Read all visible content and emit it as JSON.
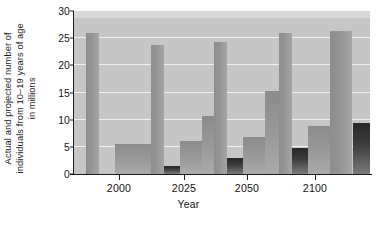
{
  "chart_data": {
    "type": "bar",
    "title": "",
    "xlabel": "Year",
    "ylabel": "Actual and projected number of individuals from 10–19 years of age in millions",
    "ylabel_lines": [
      "Actual and projected number of",
      "individuals from 10–19 years of age",
      "in millions"
    ],
    "categories": [
      "2000",
      "2025",
      "2050",
      "2100"
    ],
    "ylim": [
      0,
      30
    ],
    "yticks": [
      0,
      5,
      10,
      15,
      20,
      25,
      30
    ],
    "ytick_labels": [
      "0",
      "5",
      "10",
      "15",
      "20",
      "25",
      "30"
    ],
    "grid": true,
    "grid_color": "#f0f0f0",
    "legend": "none",
    "plot_background": "#c6c6c6",
    "colors": {
      "light_bar": "#949494",
      "mid_bar": "#9a9a9a",
      "dark_bar": "#2f2f2f",
      "axis": "#1d1d1d",
      "text": "#141414"
    },
    "groups": [
      {
        "category": "2000",
        "bars": [
          {
            "series": "tall",
            "value": 25.9,
            "shade": "light"
          },
          {
            "series": "mid-a",
            "value": 5.5,
            "shade": "mid"
          },
          {
            "series": "mid-b",
            "value": 5.5,
            "shade": "mid"
          },
          {
            "series": "short-dark",
            "value": 1.5,
            "shade": "dark"
          }
        ]
      },
      {
        "category": "2025",
        "bars": [
          {
            "series": "tall",
            "value": 23.8,
            "shade": "light"
          },
          {
            "series": "mid-a",
            "value": 6.0,
            "shade": "mid"
          },
          {
            "series": "mid-b",
            "value": 10.7,
            "shade": "mid"
          },
          {
            "series": "short-dark",
            "value": 2.9,
            "shade": "dark"
          }
        ]
      },
      {
        "category": "2050",
        "bars": [
          {
            "series": "tall",
            "value": 24.3,
            "shade": "light"
          },
          {
            "series": "mid-a",
            "value": 6.8,
            "shade": "mid"
          },
          {
            "series": "mid-b",
            "value": 15.2,
            "shade": "mid"
          },
          {
            "series": "short-dark",
            "value": 4.8,
            "shade": "dark"
          }
        ]
      },
      {
        "category": "2100",
        "bars": [
          {
            "series": "tall",
            "value": 25.9,
            "shade": "light"
          },
          {
            "series": "mid-a",
            "value": 8.9,
            "shade": "mid"
          },
          {
            "series": "mid-b",
            "value": 26.3,
            "shade": "light"
          },
          {
            "series": "short-dark",
            "value": 9.4,
            "shade": "dark"
          }
        ]
      }
    ],
    "series_values": {
      "tall": [
        25.9,
        23.8,
        24.3,
        25.9
      ],
      "mid_a": [
        5.5,
        6.0,
        6.8,
        8.9
      ],
      "mid_b": [
        5.5,
        10.7,
        15.2,
        26.3
      ],
      "short_dark": [
        1.5,
        2.9,
        4.8,
        9.4
      ]
    }
  },
  "axes": {
    "x_title": "Year",
    "y_title_line1": "Actual and projected number of",
    "y_title_line2": "individuals from 10–19 years of age",
    "y_title_line3": "in millions"
  },
  "caption": {
    "sliver": ""
  }
}
